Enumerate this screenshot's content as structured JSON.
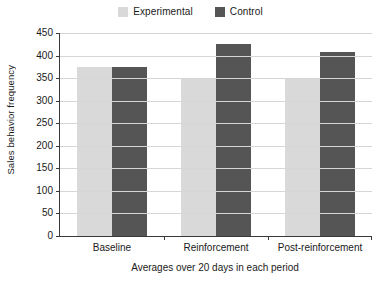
{
  "chart_data": {
    "type": "bar",
    "title": "",
    "subtitle": "",
    "xlabel": "Averages over 20 days in each period",
    "ylabel": "Sales behavior frequency",
    "categories": [
      "Baseline",
      "Reinforcement",
      "Post-reinforcement"
    ],
    "series": [
      {
        "name": "Experimental",
        "color": "#d9d9d9",
        "values": [
          375,
          350,
          351
        ]
      },
      {
        "name": "Control",
        "color": "#555555",
        "values": [
          375,
          425,
          407
        ]
      }
    ],
    "ylim": [
      0,
      450
    ],
    "ytick_step": 50,
    "ytick_labels": [
      "450",
      "400",
      "350",
      "300",
      "250",
      "200",
      "150",
      "100",
      "50",
      "0"
    ],
    "ytick_values": [
      450,
      400,
      350,
      300,
      250,
      200,
      150,
      100,
      50,
      0
    ],
    "grid": true,
    "legend_position": "top-center",
    "legend_entries": [
      {
        "label": "Experimental",
        "swatch_color": "#d9d9d9"
      },
      {
        "label": "Control",
        "swatch_color": "#555555"
      }
    ]
  },
  "colors": {
    "experimental": "#d9d9d9",
    "control": "#555555",
    "axis": "#3a3a3a",
    "grid": "#d6d6d6",
    "background": "#ffffff",
    "text": "#1a1a1a"
  }
}
